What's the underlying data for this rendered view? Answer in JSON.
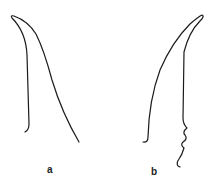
{
  "figures": [
    {
      "id": "a",
      "label": "a"
    },
    {
      "id": "b",
      "label": "b"
    }
  ],
  "colors": {
    "stroke": "#1a1a1a",
    "background": "#ffffff"
  }
}
